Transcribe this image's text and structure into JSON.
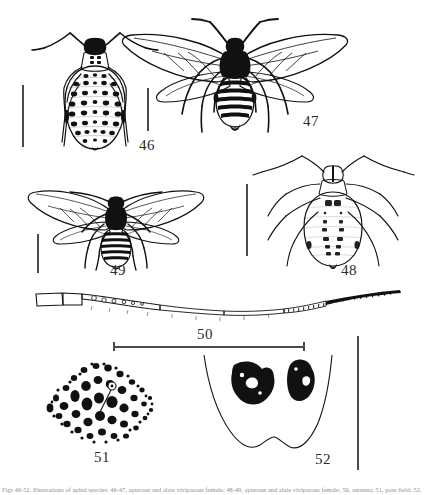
{
  "plate": {
    "title": "Aphid morphology plate, figures 46-52",
    "background_color": "#ffffff",
    "ink_color": "#111111",
    "scalebar_color": "#4a4a4a"
  },
  "figures": [
    {
      "number": "46",
      "label": "46",
      "subject": "apterous-viviparous-female-dorsal",
      "description": "Wingless aphid, dorsal view, heavily spotted abdomen with paired dark sclerites in transverse rows",
      "scalebar": "vertical"
    },
    {
      "number": "47",
      "label": "47",
      "subject": "alate-viviparous-female-dorsal",
      "description": "Winged aphid, dorsal view, dark head and thorax, banded abdomen, two pairs of veined wings spread",
      "scalebar": "vertical"
    },
    {
      "number": "48",
      "label": "48",
      "subject": "apterous-viviparous-female-dorsal-pale",
      "description": "Wingless aphid, dorsal view, pale body with small paired dorsal markings and long antennae",
      "scalebar": "vertical"
    },
    {
      "number": "49",
      "label": "49",
      "subject": "alate-viviparous-female-dorsal-small",
      "description": "Small winged aphid, dorsal view, dark banded abdomen, wings outspread",
      "scalebar": "vertical"
    },
    {
      "number": "50",
      "label": "50",
      "subject": "antenna",
      "description": "Whole antenna, segments I to VI, basal segments pale, distal segments dark and imbricated",
      "scalebar": "horizontal"
    },
    {
      "number": "51",
      "label": "51",
      "subject": "siphunculus-pore-field",
      "description": "Rounded pore field with numerous irregular cells and a single seta",
      "scalebar": "shared-vertical"
    },
    {
      "number": "52",
      "label": "52",
      "subject": "abdominal-tergite-sclerites",
      "description": "Posterior abdomen outline bearing a pair of large dark rugose sclerites",
      "scalebar": "shared-vertical"
    }
  ],
  "scale_bars": [
    {
      "id": "bar-46",
      "orientation": "vertical",
      "for_figure": "46"
    },
    {
      "id": "bar-47",
      "orientation": "vertical",
      "for_figure": "47"
    },
    {
      "id": "bar-48",
      "orientation": "vertical",
      "for_figure": "48"
    },
    {
      "id": "bar-49",
      "orientation": "vertical",
      "for_figure": "49"
    },
    {
      "id": "bar-50",
      "orientation": "horizontal",
      "for_figure": "50"
    },
    {
      "id": "bar-5152",
      "orientation": "vertical",
      "for_figure": "51, 52"
    }
  ],
  "caption": {
    "text": "Figs 46-52. Illustrations of aphid species: 46-47, apterous and alate viviparous female; 48-49, apterous and alate viviparous female; 50, antenna; 51, pore field; 52, abdominal sclerites."
  }
}
